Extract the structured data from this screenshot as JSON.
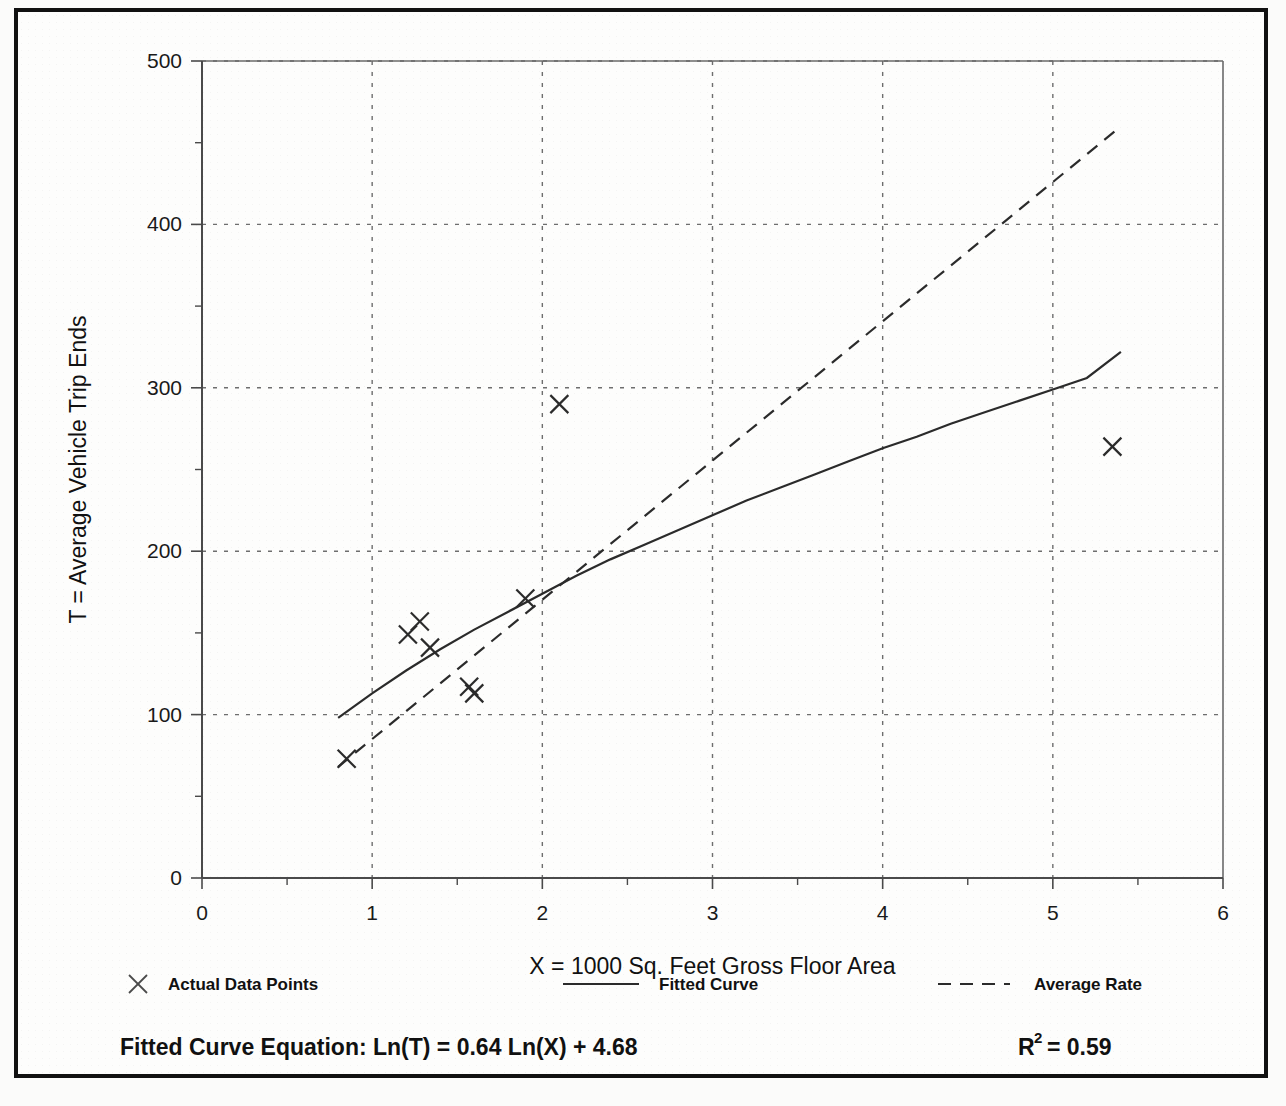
{
  "chart_data": {
    "type": "scatter",
    "title": "",
    "xlabel": "X = 1000 Sq. Feet Gross Floor Area",
    "ylabel": "T = Average Vehicle Trip Ends",
    "xlim": [
      0,
      6
    ],
    "ylim": [
      0,
      500
    ],
    "xticks": [
      0,
      1,
      2,
      3,
      4,
      5,
      6
    ],
    "xtick_labels": [
      "0",
      "1",
      "2",
      "3",
      "4",
      "5",
      "6"
    ],
    "yticks": [
      0,
      100,
      200,
      300,
      400,
      500
    ],
    "ytick_labels": [
      "0",
      "100",
      "200",
      "300",
      "400",
      "500"
    ],
    "x_minor_tick_step": 0.5,
    "y_minor_tick_step": 50,
    "grid": true,
    "grid_style": "dotted",
    "legend_position": "below-axes",
    "series": [
      {
        "name": "Actual Data Points",
        "type": "scatter",
        "marker": "x",
        "points": [
          {
            "x": 0.85,
            "y": 73
          },
          {
            "x": 1.21,
            "y": 149
          },
          {
            "x": 1.28,
            "y": 157
          },
          {
            "x": 1.34,
            "y": 141
          },
          {
            "x": 1.57,
            "y": 117
          },
          {
            "x": 1.6,
            "y": 113
          },
          {
            "x": 1.9,
            "y": 171
          },
          {
            "x": 2.1,
            "y": 290
          },
          {
            "x": 5.35,
            "y": 264
          }
        ]
      },
      {
        "name": "Fitted Curve",
        "type": "line",
        "line_style": "solid",
        "equation": "Ln(T) = 0.64 Ln(X) + 4.68",
        "x_range": [
          0.8,
          5.4
        ],
        "points": [
          {
            "x": 0.8,
            "y": 98
          },
          {
            "x": 1.0,
            "y": 113
          },
          {
            "x": 1.2,
            "y": 127
          },
          {
            "x": 1.4,
            "y": 140
          },
          {
            "x": 1.6,
            "y": 152
          },
          {
            "x": 1.8,
            "y": 163
          },
          {
            "x": 2.0,
            "y": 174
          },
          {
            "x": 2.2,
            "y": 185
          },
          {
            "x": 2.4,
            "y": 195
          },
          {
            "x": 2.6,
            "y": 204
          },
          {
            "x": 2.8,
            "y": 213
          },
          {
            "x": 3.0,
            "y": 222
          },
          {
            "x": 3.2,
            "y": 231
          },
          {
            "x": 3.4,
            "y": 239
          },
          {
            "x": 3.6,
            "y": 247
          },
          {
            "x": 3.8,
            "y": 255
          },
          {
            "x": 4.0,
            "y": 263
          },
          {
            "x": 4.2,
            "y": 270
          },
          {
            "x": 4.4,
            "y": 278
          },
          {
            "x": 4.6,
            "y": 285
          },
          {
            "x": 4.8,
            "y": 292
          },
          {
            "x": 5.0,
            "y": 299
          },
          {
            "x": 5.2,
            "y": 306
          },
          {
            "x": 5.4,
            "y": 322
          }
        ]
      },
      {
        "name": "Average Rate",
        "type": "line",
        "line_style": "dashed",
        "points": [
          {
            "x": 0.8,
            "y": 68
          },
          {
            "x": 5.4,
            "y": 460
          }
        ]
      }
    ]
  },
  "legend": {
    "items": [
      {
        "label": "Actual Data Points",
        "symbol": "x-marker"
      },
      {
        "label": "Fitted Curve",
        "symbol": "solid-line"
      },
      {
        "label": "Average Rate",
        "symbol": "dashed-line"
      }
    ]
  },
  "footer": {
    "equation_label": "Fitted Curve Equation:  Ln(T) = 0.64 Ln(X) + 4.68",
    "r_squared_base": "R",
    "r_squared_exp": "2",
    "r_squared_value": "= 0.59"
  },
  "colors": {
    "ink": "#2b2b2b",
    "axis": "#4a4a4a",
    "grid": "#6e6e6e",
    "frame": "#111111",
    "paper": "#fdfdfc"
  }
}
